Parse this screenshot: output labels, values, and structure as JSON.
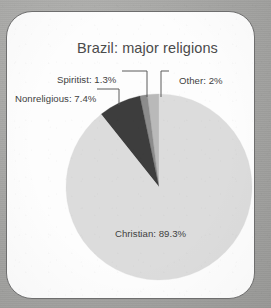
{
  "card": {
    "background_color": "#fdfdfd",
    "border_color": "#6e6e6e",
    "page_background_color": "#a8a8a6"
  },
  "chart_data": {
    "type": "pie",
    "title": "Brazil: major religions",
    "xlabel": "",
    "ylabel": "",
    "units": "percent",
    "legend": "none",
    "grid": false,
    "start_angle_deg": 0,
    "direction": "counterclockwise",
    "categories": [
      "Other",
      "Spiritist",
      "Nonreligious",
      "Christian"
    ],
    "values": [
      2,
      1.3,
      7.4,
      89.3
    ],
    "colors": [
      "#b9b9b9",
      "#8c8c8c",
      "#3d3d3d",
      "#dcdcdc"
    ],
    "slices": [
      {
        "name": "Other",
        "value": 2,
        "label": "Other: 2%",
        "color": "#b9b9b9",
        "leader": true
      },
      {
        "name": "Spiritist",
        "value": 1.3,
        "label": "Spiritist: 1.3%",
        "color": "#8c8c8c",
        "leader": true
      },
      {
        "name": "Nonreligious",
        "value": 7.4,
        "label": "Nonreligious: 7.4%",
        "color": "#3d3d3d",
        "leader": true
      },
      {
        "name": "Christian",
        "value": 89.3,
        "label": "Christian: 89.3%",
        "color": "#dcdcdc",
        "leader": false
      }
    ],
    "center": {
      "x": 158,
      "y": 186
    },
    "radius": 93
  }
}
